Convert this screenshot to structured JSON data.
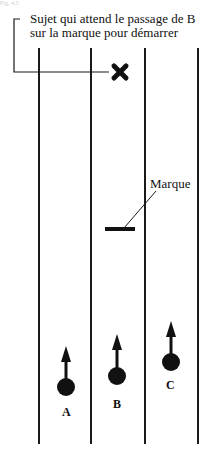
{
  "header": {
    "faint_text": "Fig. 4.5"
  },
  "callout": {
    "line1": "Sujet qui attend le passage de B",
    "line2": "sur la marque pour démarrer"
  },
  "marker": {
    "label": "Marque"
  },
  "runners": [
    {
      "id": "A",
      "label": "A"
    },
    {
      "id": "B",
      "label": "B"
    },
    {
      "id": "C",
      "label": "C"
    }
  ],
  "lanes": {
    "count": 4
  },
  "colors": {
    "ink": "#1a1a1a",
    "background": "#ffffff"
  }
}
